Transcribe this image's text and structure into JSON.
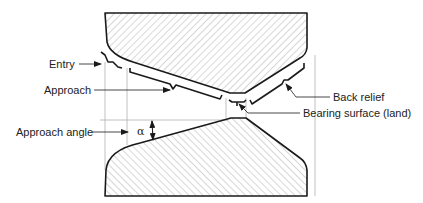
{
  "diagram": {
    "labels": {
      "entry": "Entry",
      "approach": "Approach",
      "approach_angle": "Approach angle",
      "alpha": "α",
      "back_relief": "Back relief",
      "bearing_surface": "Bearing surface (land)"
    },
    "colors": {
      "outline": "#1a1a1a",
      "hatch": "#9a9a9a",
      "guide": "#b0b0b0",
      "text": "#222222",
      "background": "#ffffff"
    }
  }
}
